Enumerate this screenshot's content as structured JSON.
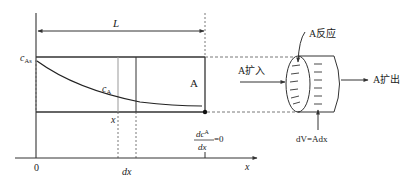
{
  "diagram": {
    "labels": {
      "length": "L",
      "surface_conc": "c",
      "surface_conc_sub": "As",
      "conc": "c",
      "conc_sub": "A",
      "area": "A",
      "position": "x",
      "differential": "dx",
      "origin": "0",
      "axis": "x",
      "bc_num": "dc",
      "bc_num_sub": "A",
      "bc_den": "dx",
      "bc_eq": "=0",
      "reaction": "A反应",
      "diffuse_in": "A扩入",
      "diffuse_out": "A扩出",
      "volume_element": "dV=Adx"
    },
    "colors": {
      "line": "#333333",
      "light_line": "#999999",
      "text": "#222222"
    }
  }
}
